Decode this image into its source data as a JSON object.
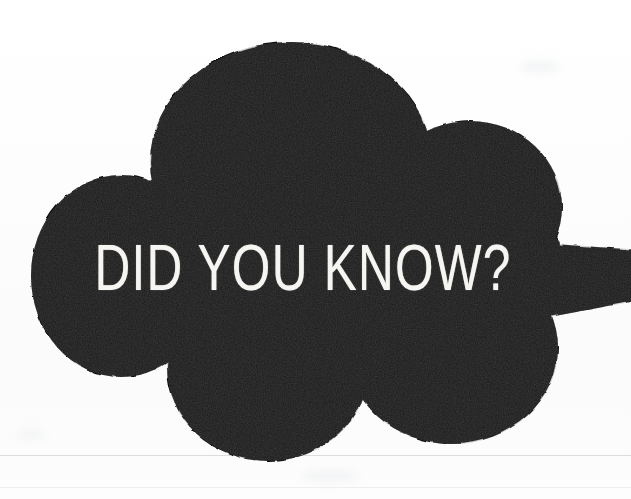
{
  "graphic": {
    "kind": "scanned-illustration",
    "headline": "DID YOU KNOW?",
    "shape_name": "cloud-blob-speech-bubble",
    "colors": {
      "ink": "#111111",
      "paper": "#fefefe",
      "text": "#f6f5f2",
      "scan_line": "#82878f"
    },
    "lobes": [
      {
        "name": "top-lobe",
        "cx": 290,
        "cy": 160,
        "rx": 140,
        "ry": 120
      },
      {
        "name": "upper-right-lobe",
        "cx": 468,
        "cy": 205,
        "rx": 90,
        "ry": 85
      },
      {
        "name": "left-lobe",
        "cx": 122,
        "cy": 275,
        "rx": 90,
        "ry": 100
      },
      {
        "name": "bottom-left-lobe",
        "cx": 268,
        "cy": 370,
        "rx": 100,
        "ry": 92
      },
      {
        "name": "bottom-right-lobe",
        "cx": 450,
        "cy": 350,
        "rx": 105,
        "ry": 95
      },
      {
        "name": "right-tail-point",
        "tip_x": 631,
        "tip_y": 286
      }
    ]
  }
}
